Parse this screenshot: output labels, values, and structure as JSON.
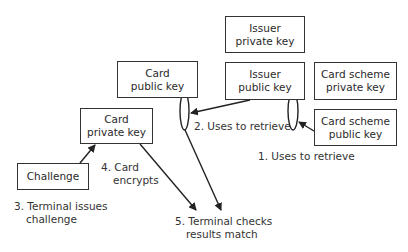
{
  "diagram": {
    "boxes": {
      "issuer_private_key": {
        "line1": "Issuer",
        "line2": "private key"
      },
      "issuer_public_key": {
        "line1": "Issuer",
        "line2": "public key"
      },
      "card_public_key": {
        "line1": "Card",
        "line2": "public key"
      },
      "card_private_key": {
        "line1": "Card",
        "line2": "private key"
      },
      "card_scheme_private_key": {
        "line1": "Card scheme",
        "line2": "private key"
      },
      "card_scheme_public_key": {
        "line1": "Card scheme",
        "line2": "public key"
      },
      "challenge": {
        "line1": "Challenge"
      }
    },
    "steps": {
      "step1": {
        "line1": "1. Uses to retrieve"
      },
      "step2": {
        "line1": "2. Uses to retrieve"
      },
      "step3": {
        "line1": "3. Terminal issues",
        "line2": "challenge"
      },
      "step4": {
        "line1": "4. Card",
        "line2": "encrypts"
      },
      "step5": {
        "line1": "5. Terminal checks",
        "line2": "results match"
      }
    },
    "colors": {
      "stroke": "#333333",
      "background": "#ffffff"
    }
  }
}
